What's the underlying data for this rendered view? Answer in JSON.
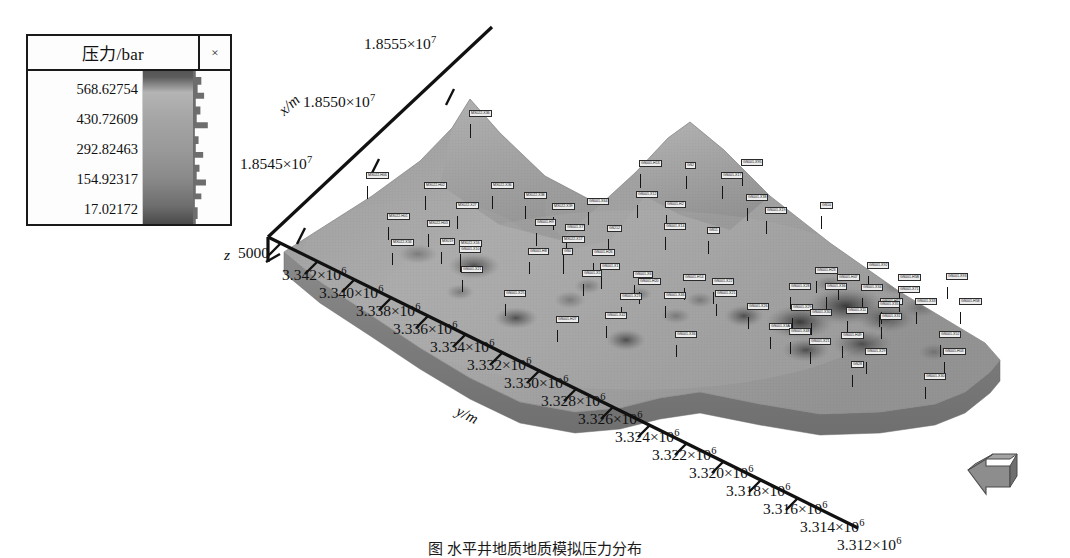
{
  "legend": {
    "title": "压力/bar",
    "close_label": "×",
    "ticks": [
      "568.62754",
      "430.72609",
      "292.82463",
      "154.92317",
      "17.02172"
    ]
  },
  "axes": {
    "x_title": "x/m",
    "y_title": "y/m",
    "z_title": "z",
    "z_value": "5000",
    "x_ticks": [
      "1.8555×10",
      "1.8550×10",
      "1.8545×10"
    ],
    "x_exp": "7",
    "y_exp": "6",
    "y_ticks": [
      "3.342×10",
      "3.340×10",
      "3.338×10",
      "3.336×10",
      "3.334×10",
      "3.332×10",
      "3.330×10",
      "3.328×10",
      "3.326×10",
      "3.324×10",
      "3.322×10",
      "3.320×10",
      "3.318×10",
      "3.316×10",
      "3.314×10",
      "3.312×10"
    ]
  },
  "chart_data": {
    "type": "heatmap",
    "title": "压力/bar",
    "xlabel": "x/m",
    "ylabel": "y/m",
    "zlabel": "z",
    "colorbar_label": "压力/bar",
    "colorbar_ticks": [
      568.62754,
      430.72609,
      292.82463,
      154.92317,
      17.02172
    ],
    "colorbar_min": 17.02172,
    "colorbar_max": 568.62754,
    "colormap": "grayscale",
    "grid": false,
    "legend_position": "top-left",
    "xlim": [
      18542500,
      18556500
    ],
    "ylim": [
      3311000,
      3343000
    ],
    "zlim": [
      0,
      5000
    ],
    "x_ticks": [
      18545000,
      18550000,
      18555000
    ],
    "y_ticks": [
      3342000,
      3340000,
      3338000,
      3336000,
      3334000,
      3332000,
      3330000,
      3328000,
      3326000,
      3324000,
      3322000,
      3320000,
      3318000,
      3316000,
      3314000,
      3312000
    ],
    "projection": "3d-surface"
  },
  "wells": [
    {
      "label": "MX022-X36",
      "x": 470,
      "y": 124,
      "h": 14
    },
    {
      "label": "MX022-H02",
      "x": 425,
      "y": 196,
      "h": 14
    },
    {
      "label": "MX022-H06",
      "x": 367,
      "y": 186,
      "h": 13
    },
    {
      "label": "MX022-X36",
      "x": 492,
      "y": 196,
      "h": 13
    },
    {
      "label": "MX022-X38",
      "x": 525,
      "y": 206,
      "h": 13
    },
    {
      "label": "MX022-X39",
      "x": 553,
      "y": 217,
      "h": 13
    },
    {
      "label": "MX022-X27",
      "x": 457,
      "y": 216,
      "h": 13
    },
    {
      "label": "MX022-H01",
      "x": 388,
      "y": 227,
      "h": 13
    },
    {
      "label": "MX022-H03",
      "x": 428,
      "y": 234,
      "h": 13
    },
    {
      "label": "MX022-X34",
      "x": 392,
      "y": 253,
      "h": 12
    },
    {
      "label": "MX019",
      "x": 441,
      "y": 252,
      "h": 12
    },
    {
      "label": "MX022-X16",
      "x": 460,
      "y": 254,
      "h": 13
    },
    {
      "label": "GS001-H13",
      "x": 640,
      "y": 174,
      "h": 14
    },
    {
      "label": "GS2",
      "x": 686,
      "y": 176,
      "h": 13
    },
    {
      "label": "GS001-X95",
      "x": 742,
      "y": 173,
      "h": 13
    },
    {
      "label": "GS001-X17",
      "x": 722,
      "y": 186,
      "h": 13
    },
    {
      "label": "GS001-X12",
      "x": 637,
      "y": 205,
      "h": 13
    },
    {
      "label": "GS001-X38",
      "x": 747,
      "y": 208,
      "h": 13
    },
    {
      "label": "GS001-X64",
      "x": 588,
      "y": 212,
      "h": 13
    },
    {
      "label": "GS001-H2",
      "x": 666,
      "y": 215,
      "h": 13
    },
    {
      "label": "GS001-X19",
      "x": 766,
      "y": 221,
      "h": 13
    },
    {
      "label": "GS10",
      "x": 821,
      "y": 216,
      "h": 13
    },
    {
      "label": "GS001-H9",
      "x": 536,
      "y": 233,
      "h": 13
    },
    {
      "label": "GS001-X7",
      "x": 566,
      "y": 238,
      "h": 13
    },
    {
      "label": "GS001-X14",
      "x": 665,
      "y": 237,
      "h": 13
    },
    {
      "label": "MX022-X17",
      "x": 563,
      "y": 250,
      "h": 12
    },
    {
      "label": "GS212",
      "x": 608,
      "y": 239,
      "h": 13
    },
    {
      "label": "GS11",
      "x": 708,
      "y": 241,
      "h": 13
    },
    {
      "label": "GS001-X10",
      "x": 460,
      "y": 260,
      "h": 12
    },
    {
      "label": "GS001-H8",
      "x": 529,
      "y": 262,
      "h": 12
    },
    {
      "label": "GS0",
      "x": 563,
      "y": 262,
      "h": 12
    },
    {
      "label": "GS001-H26",
      "x": 593,
      "y": 263,
      "h": 12
    },
    {
      "label": "GS001-X1",
      "x": 601,
      "y": 277,
      "h": 12
    },
    {
      "label": "GS001-X21",
      "x": 462,
      "y": 280,
      "h": 12
    },
    {
      "label": "GS001-X5",
      "x": 583,
      "y": 284,
      "h": 12
    },
    {
      "label": "GS001-X6",
      "x": 634,
      "y": 285,
      "h": 12
    },
    {
      "label": "GS001-H20",
      "x": 639,
      "y": 292,
      "h": 12
    },
    {
      "label": "GS001-H14",
      "x": 684,
      "y": 288,
      "h": 12
    },
    {
      "label": "GS001-X22",
      "x": 713,
      "y": 292,
      "h": 12
    },
    {
      "label": "GS001-H23",
      "x": 816,
      "y": 281,
      "h": 12
    },
    {
      "label": "GS001-X92",
      "x": 868,
      "y": 276,
      "h": 12
    },
    {
      "label": "GS001-H47",
      "x": 838,
      "y": 288,
      "h": 12
    },
    {
      "label": "GS001-H5B",
      "x": 899,
      "y": 288,
      "h": 12
    },
    {
      "label": "GS001-X93",
      "x": 947,
      "y": 287,
      "h": 12
    },
    {
      "label": "GS001-X25",
      "x": 505,
      "y": 304,
      "h": 12
    },
    {
      "label": "GS001-X23",
      "x": 621,
      "y": 307,
      "h": 12
    },
    {
      "label": "GS001-X46",
      "x": 665,
      "y": 306,
      "h": 12
    },
    {
      "label": "GS001-X21",
      "x": 716,
      "y": 304,
      "h": 12
    },
    {
      "label": "GS001-X28",
      "x": 790,
      "y": 297,
      "h": 12
    },
    {
      "label": "GS001-X36",
      "x": 826,
      "y": 297,
      "h": 12
    },
    {
      "label": "GS001-X34",
      "x": 862,
      "y": 298,
      "h": 12
    },
    {
      "label": "GS001-X71",
      "x": 899,
      "y": 300,
      "h": 12
    },
    {
      "label": "GS001-H57",
      "x": 881,
      "y": 312,
      "h": 12
    },
    {
      "label": "GS001-H58",
      "x": 960,
      "y": 312,
      "h": 12
    },
    {
      "label": "GS001-H27",
      "x": 557,
      "y": 330,
      "h": 12
    },
    {
      "label": "GS001-X42",
      "x": 606,
      "y": 326,
      "h": 12
    },
    {
      "label": "GS001-X26",
      "x": 748,
      "y": 317,
      "h": 12
    },
    {
      "label": "GS001-X29",
      "x": 792,
      "y": 318,
      "h": 12
    },
    {
      "label": "GS001-X30",
      "x": 811,
      "y": 323,
      "h": 12
    },
    {
      "label": "GS001-X11",
      "x": 847,
      "y": 321,
      "h": 12
    },
    {
      "label": "GS001-X35",
      "x": 879,
      "y": 315,
      "h": 12
    },
    {
      "label": "GS001-X33",
      "x": 916,
      "y": 312,
      "h": 12
    },
    {
      "label": "GS001-X31",
      "x": 881,
      "y": 327,
      "h": 12
    },
    {
      "label": "GS001-X36",
      "x": 676,
      "y": 345,
      "h": 12
    },
    {
      "label": "GS001-X3A",
      "x": 770,
      "y": 337,
      "h": 12
    },
    {
      "label": "GS001-X48",
      "x": 790,
      "y": 342,
      "h": 12
    },
    {
      "label": "GS001-X21",
      "x": 810,
      "y": 352,
      "h": 12
    },
    {
      "label": "GS001-H49",
      "x": 842,
      "y": 346,
      "h": 12
    },
    {
      "label": "GS001-X52",
      "x": 940,
      "y": 345,
      "h": 12
    },
    {
      "label": "GS001-H03",
      "x": 944,
      "y": 362,
      "h": 12
    },
    {
      "label": "GS001-X29",
      "x": 866,
      "y": 362,
      "h": 12
    },
    {
      "label": "GS28",
      "x": 852,
      "y": 375,
      "h": 12
    },
    {
      "label": "GS001-X30",
      "x": 925,
      "y": 387,
      "h": 12
    }
  ],
  "caption": "图    水平井地质地质模拟压力分布"
}
